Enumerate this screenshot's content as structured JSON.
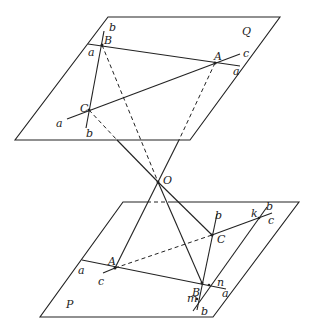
{
  "diagram": {
    "planes": {
      "Q": {
        "label": "Q",
        "corners": [
          [
            108,
            17
          ],
          [
            280,
            17
          ],
          [
            190,
            140
          ],
          [
            15,
            140
          ]
        ]
      },
      "P": {
        "label": "P",
        "corners": [
          [
            123,
            202
          ],
          [
            299,
            202
          ],
          [
            213,
            317
          ],
          [
            40,
            317
          ]
        ]
      }
    },
    "center": {
      "label": "O",
      "x": 158,
      "y": 182
    },
    "Q_points": {
      "A": {
        "label": "A",
        "x": 215,
        "y": 63
      },
      "B": {
        "label": "B",
        "x": 102,
        "y": 45
      },
      "C": {
        "label": "C",
        "x": 89,
        "y": 110
      }
    },
    "P_points": {
      "A": {
        "label": "A",
        "x": 115,
        "y": 268
      },
      "B": {
        "label": "B",
        "x": 202,
        "y": 283
      },
      "C": {
        "label": "C",
        "x": 212,
        "y": 235
      },
      "k": {
        "label": "k",
        "x": 259,
        "y": 218
      },
      "n": {
        "label": "n",
        "x": 209,
        "y": 285
      },
      "m": {
        "label": "m",
        "x": 196,
        "y": 299
      }
    },
    "labels": {
      "Q": "Q",
      "P": "P",
      "O": "O",
      "QA": "A",
      "QB": "B",
      "QC": "C",
      "PA": "A",
      "PB": "B",
      "PC": "C",
      "Q_b_top": "b",
      "Q_b_bottom": "b",
      "Q_a_left": "a",
      "Q_a_right": "a",
      "Q_a_lower": "a",
      "Q_c": "c",
      "P_b_C": "b",
      "P_b_k": "b",
      "P_b_bottom": "b",
      "P_c_right": "c",
      "P_c_left": "c",
      "P_a_left": "a",
      "P_a_right": "a",
      "k": "k",
      "n": "n",
      "m": "m"
    }
  }
}
